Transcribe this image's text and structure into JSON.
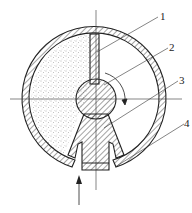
{
  "diagram": {
    "type": "cross-section",
    "labels": [
      {
        "id": "1",
        "text": "1"
      },
      {
        "id": "2",
        "text": "2"
      },
      {
        "id": "3",
        "text": "3"
      },
      {
        "id": "4",
        "text": "4"
      }
    ],
    "flow_arrow": "inlet-arrow-up",
    "rotation_arrow": "clockwise",
    "colors": {
      "line": "#222222",
      "hatch": "#333333",
      "stipple": "#555555",
      "background": "#ffffff"
    }
  }
}
